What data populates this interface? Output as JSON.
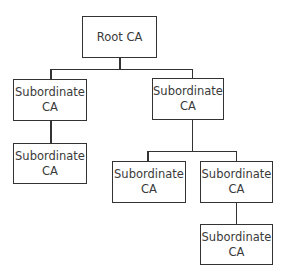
{
  "diagram": {
    "type": "tree",
    "title": "",
    "nodes": [
      {
        "id": "root",
        "line1": "Root CA",
        "line2": ""
      },
      {
        "id": "sub_left",
        "line1": "Subordinate",
        "line2": "CA",
        "parent": "root"
      },
      {
        "id": "sub_right",
        "line1": "Subordinate",
        "line2": "CA",
        "parent": "root"
      },
      {
        "id": "sub_left_child",
        "line1": "Subordinate",
        "line2": "CA",
        "parent": "sub_left"
      },
      {
        "id": "sub_right_child_a",
        "line1": "Subordinate",
        "line2": "CA",
        "parent": "sub_right"
      },
      {
        "id": "sub_right_child_b",
        "line1": "Subordinate",
        "line2": "CA",
        "parent": "sub_right"
      },
      {
        "id": "sub_right_child_b_child",
        "line1": "Subordinate",
        "line2": "CA",
        "parent": "sub_right_child_b"
      }
    ],
    "colors": {
      "stroke": "#333333",
      "text": "#3a3a3a",
      "background": "#ffffff"
    }
  }
}
